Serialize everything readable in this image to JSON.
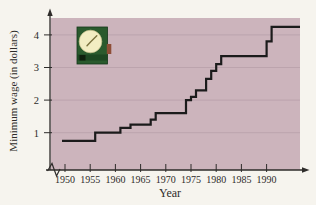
{
  "colors": {
    "page_bg": "#f6f4ee",
    "plot_bg": "#ccb4bc",
    "gridline": "#b89fa9",
    "axis": "#2e2c2a",
    "text": "#2e2c2a",
    "line": "#1b1b1b",
    "clock_body": "#2a5a2d",
    "clock_body_edge": "#16381a",
    "clock_band": "#1d4722",
    "clock_notch": "#0e1f0d",
    "clock_tab": "#8e4d36",
    "clock_face": "#f2edc2",
    "clock_face_edge": "#c9c28e",
    "clock_hands": "#7c7440"
  },
  "icons": {
    "clock": "clock-icon"
  },
  "chart_data": {
    "type": "line",
    "line_style": "step-after",
    "title": "",
    "xlabel": "Year",
    "ylabel": "Minimum wage (in dollars)",
    "x_ticks": [
      1950,
      1955,
      1960,
      1965,
      1970,
      1975,
      1980,
      1985,
      1990
    ],
    "y_ticks": [
      1,
      2,
      3,
      4
    ],
    "x_range": [
      1950,
      1996.5
    ],
    "y_range": [
      0,
      4.6
    ],
    "x_axis_break": true,
    "grid": "horizontal",
    "legend": null,
    "series": [
      {
        "name": "Minimum wage",
        "points": [
          {
            "year": 1950,
            "value": 0.75
          },
          {
            "year": 1956,
            "value": 1.0
          },
          {
            "year": 1961,
            "value": 1.15
          },
          {
            "year": 1963,
            "value": 1.25
          },
          {
            "year": 1967,
            "value": 1.4
          },
          {
            "year": 1968,
            "value": 1.6
          },
          {
            "year": 1974,
            "value": 2.0
          },
          {
            "year": 1975,
            "value": 2.1
          },
          {
            "year": 1976,
            "value": 2.3
          },
          {
            "year": 1978,
            "value": 2.65
          },
          {
            "year": 1979,
            "value": 2.9
          },
          {
            "year": 1980,
            "value": 3.1
          },
          {
            "year": 1981,
            "value": 3.35
          },
          {
            "year": 1990,
            "value": 3.8
          },
          {
            "year": 1991,
            "value": 4.25
          }
        ]
      }
    ]
  }
}
